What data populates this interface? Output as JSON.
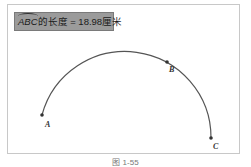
{
  "measurement": {
    "arc_label": "ABC",
    "text": "的长度 = 18.98厘米"
  },
  "points": {
    "A": {
      "label": "A",
      "x": 42,
      "y": 115
    },
    "B": {
      "label": "B",
      "x": 167,
      "y": 62
    },
    "C": {
      "label": "C",
      "x": 211,
      "y": 138
    }
  },
  "caption": "图 1-55",
  "colors": {
    "arc": "#555555",
    "measure_bg": "#9b9b9b"
  }
}
